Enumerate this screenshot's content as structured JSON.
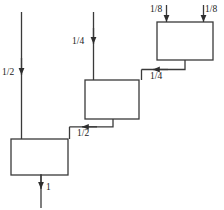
{
  "diagram": {
    "type": "block-flow-diagram",
    "stroke_color": "#3a3a3a",
    "text_color": "#1a1a1a",
    "background_color": "#ffffff",
    "blocks": [
      {
        "id": "block-top",
        "name": "top-block",
        "x": 157,
        "y": 22,
        "width": 56,
        "height": 38
      },
      {
        "id": "block-middle",
        "name": "middle-block",
        "x": 85,
        "y": 80,
        "width": 54,
        "height": 39
      },
      {
        "id": "block-bottom",
        "name": "bottom-block",
        "x": 11,
        "y": 139,
        "width": 57,
        "height": 36
      }
    ],
    "labels": [
      {
        "id": "label-eighth-left",
        "text": "1/8",
        "x": 150,
        "y": 4,
        "align": "left"
      },
      {
        "id": "label-eighth-right",
        "text": "1/8",
        "x": 205,
        "y": 4,
        "align": "left"
      },
      {
        "id": "label-quarter-in",
        "text": "1/4",
        "x": 72,
        "y": 36,
        "align": "left"
      },
      {
        "id": "label-quarter-flow",
        "text": "1/4",
        "x": 150,
        "y": 71,
        "align": "left"
      },
      {
        "id": "label-half-in",
        "text": "1/2",
        "x": 2,
        "y": 67,
        "align": "left"
      },
      {
        "id": "label-half-flow",
        "text": "1/2",
        "x": 77,
        "y": 128,
        "align": "left"
      },
      {
        "id": "label-one-out",
        "text": "1",
        "x": 46,
        "y": 182,
        "align": "left"
      }
    ],
    "streams": [
      {
        "id": "stream-eighth-left",
        "name": "feed-stream-eighth-left",
        "value": "1/8"
      },
      {
        "id": "stream-eighth-right",
        "name": "feed-stream-eighth-right",
        "value": "1/8"
      },
      {
        "id": "stream-quarter-feed",
        "name": "feed-stream-quarter",
        "value": "1/4"
      },
      {
        "id": "stream-quarter-link",
        "name": "link-stream-quarter",
        "value": "1/4"
      },
      {
        "id": "stream-half-feed",
        "name": "feed-stream-half",
        "value": "1/2"
      },
      {
        "id": "stream-half-link",
        "name": "link-stream-half",
        "value": "1/2"
      },
      {
        "id": "stream-one-product",
        "name": "product-stream-one",
        "value": "1"
      }
    ]
  }
}
